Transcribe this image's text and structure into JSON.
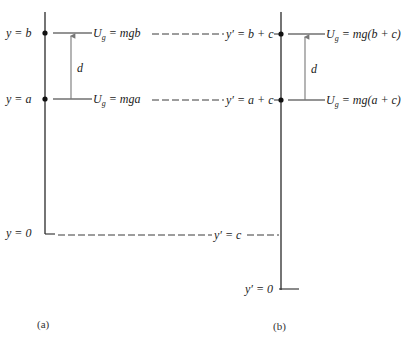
{
  "diagram": {
    "colors": {
      "line": "#2a2a2a",
      "dash": "#3a3a3a",
      "arrow": "#777777",
      "text": "#222222"
    },
    "panel_a": {
      "caption": "(a)",
      "labels": {
        "y_b": "y = b",
        "y_a": "y = a",
        "y_0": "y = 0",
        "d": "d",
        "U_b_pre": "U",
        "U_b_sub": "g",
        "U_b_post": " = mgb",
        "U_a_pre": "U",
        "U_a_sub": "g",
        "U_a_post": " = mga"
      }
    },
    "panel_b": {
      "caption": "(b)",
      "labels": {
        "yp_bc": "y′ = b + c",
        "yp_ac": "y′ = a + c",
        "yp_c": "y′ = c",
        "yp_0": "y′ = 0",
        "d": "d",
        "U_b_pre": "U",
        "U_b_sub": "g",
        "U_b_post": " = mg(b + c)",
        "U_a_pre": "U",
        "U_a_sub": "g",
        "U_a_post": " = mg(a + c)"
      }
    }
  }
}
